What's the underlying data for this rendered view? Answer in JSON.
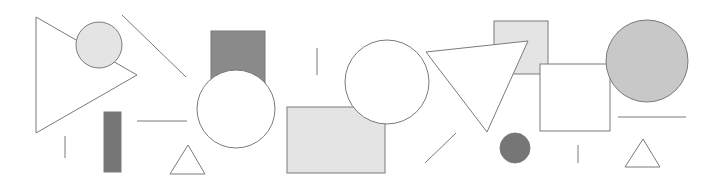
{
  "colors": {
    "stroke": "#7a7a7a",
    "light_fill": "#e4e4e4",
    "medium_fill": "#c8c8c8",
    "dark_fill": "#8a8a8a",
    "darkest_fill": "#767676",
    "white_fill": "#ffffff"
  },
  "shapes": [
    {
      "name": "large-triangle-left",
      "kind": "triangle",
      "fill": "white_fill"
    },
    {
      "name": "small-light-circle",
      "kind": "circle",
      "fill": "light_fill"
    },
    {
      "name": "diagonal-line-1",
      "kind": "line"
    },
    {
      "name": "vertical-line-1",
      "kind": "line"
    },
    {
      "name": "dark-tall-rectangle",
      "kind": "rect",
      "fill": "darkest_fill"
    },
    {
      "name": "horizontal-line-1",
      "kind": "line"
    },
    {
      "name": "small-triangle-1",
      "kind": "triangle",
      "fill": "white_fill"
    },
    {
      "name": "dark-rectangle",
      "kind": "rect",
      "fill": "dark_fill"
    },
    {
      "name": "white-circle-1",
      "kind": "circle",
      "fill": "white_fill"
    },
    {
      "name": "vertical-line-2",
      "kind": "line"
    },
    {
      "name": "light-rectangle",
      "kind": "rect",
      "fill": "light_fill"
    },
    {
      "name": "white-circle-2",
      "kind": "circle",
      "fill": "white_fill"
    },
    {
      "name": "light-square",
      "kind": "rect",
      "fill": "light_fill"
    },
    {
      "name": "large-triangle-right",
      "kind": "triangle",
      "fill": "white_fill"
    },
    {
      "name": "white-square",
      "kind": "rect",
      "fill": "white_fill"
    },
    {
      "name": "gray-circle",
      "kind": "circle",
      "fill": "medium_fill"
    },
    {
      "name": "horizontal-line-2",
      "kind": "line"
    },
    {
      "name": "diagonal-line-2",
      "kind": "line"
    },
    {
      "name": "small-dark-circle",
      "kind": "circle",
      "fill": "darkest_fill"
    },
    {
      "name": "vertical-line-3",
      "kind": "line"
    },
    {
      "name": "small-triangle-2",
      "kind": "triangle",
      "fill": "white_fill"
    }
  ]
}
